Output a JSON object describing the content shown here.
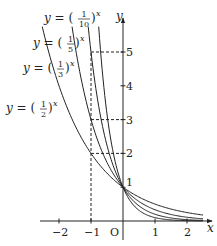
{
  "chart_data": {
    "type": "line",
    "title": "",
    "xlabel": "x",
    "ylabel": "y",
    "origin_label": "O",
    "xlim": [
      -2.5,
      2.5
    ],
    "ylim": [
      -0.3,
      5.8
    ],
    "grid": false,
    "x_ticks": [
      "-2",
      "-1",
      "1",
      "2"
    ],
    "x_tick_values": [
      -2,
      -1,
      1,
      2
    ],
    "y_ticks": [
      "1",
      "2",
      "3",
      "4",
      "5"
    ],
    "y_tick_values": [
      1,
      2,
      3,
      4,
      5
    ],
    "series": [
      {
        "name": "y = (1/10)^x",
        "base": 0.1,
        "num": "1",
        "den": "10"
      },
      {
        "name": "y = (1/5)^x",
        "base": 0.2,
        "num": "1",
        "den": "5"
      },
      {
        "name": "y = (1/3)^x",
        "base": 0.3333,
        "num": "1",
        "den": "3"
      },
      {
        "name": "y = (1/2)^x",
        "base": 0.5,
        "num": "1",
        "den": "2"
      }
    ],
    "annotations": [
      {
        "type": "dashed-guide",
        "from": [
          -1,
          0
        ],
        "to": [
          -1,
          5
        ],
        "note": "vertical at x=-1"
      },
      {
        "type": "dashed-guide",
        "from": [
          -1,
          5
        ],
        "to": [
          0,
          5
        ],
        "note": "(1/5)^-1 = 5"
      },
      {
        "type": "dashed-guide",
        "from": [
          -1,
          3
        ],
        "to": [
          0,
          3
        ],
        "note": "(1/3)^-1 = 3"
      },
      {
        "type": "dashed-guide",
        "from": [
          -1,
          2
        ],
        "to": [
          0,
          2
        ],
        "note": "(1/2)^-1 = 2"
      }
    ],
    "common_point": [
      0,
      1
    ]
  }
}
